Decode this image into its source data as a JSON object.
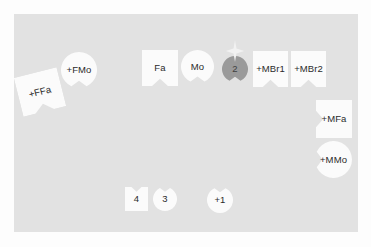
{
  "scene": {
    "title": "Graph node workspace",
    "background_color": "#fdfdfd",
    "panel_color": "#e2e2e2",
    "node_fill": "#fbfbfb",
    "node_fill_active": "#9a9a9a",
    "text_color": "#2a2a2a"
  },
  "nodes": [
    {
      "id": "ffa",
      "label": "+FFa",
      "shape": "square",
      "notch": "bottom",
      "fill": "#fbfbfb",
      "rotation": -14,
      "x": 18,
      "y": 72,
      "w": 44,
      "h": 40
    },
    {
      "id": "fmo",
      "label": "+FMo",
      "shape": "circle",
      "notch": "bottom",
      "fill": "#fbfbfb",
      "rotation": 0,
      "x": 61,
      "y": 52,
      "w": 36,
      "h": 36
    },
    {
      "id": "fa",
      "label": "Fa",
      "shape": "square",
      "notch": "bottom",
      "fill": "#fbfbfb",
      "rotation": 0,
      "x": 142,
      "y": 50,
      "w": 36,
      "h": 36
    },
    {
      "id": "mo",
      "label": "Mo",
      "shape": "circle",
      "notch": "bottom",
      "fill": "#fbfbfb",
      "rotation": 0,
      "x": 181,
      "y": 50,
      "w": 33,
      "h": 33
    },
    {
      "id": "n2",
      "label": "2",
      "shape": "circle",
      "notch": "bottom",
      "fill": "#9a9a9a",
      "rotation": 0,
      "x": 222,
      "y": 56,
      "w": 26,
      "h": 26
    },
    {
      "id": "mbr1",
      "label": "+MBr1",
      "shape": "square",
      "notch": "bottom",
      "fill": "#fbfbfb",
      "rotation": 0,
      "x": 253,
      "y": 51,
      "w": 35,
      "h": 36
    },
    {
      "id": "mbr2",
      "label": "+MBr2",
      "shape": "square",
      "notch": "bottom",
      "fill": "#fbfbfb",
      "rotation": 0,
      "x": 291,
      "y": 51,
      "w": 35,
      "h": 36
    },
    {
      "id": "mfa",
      "label": "+MFa",
      "shape": "square",
      "notch": "left",
      "fill": "#fbfbfb",
      "rotation": 0,
      "x": 316,
      "y": 100,
      "w": 36,
      "h": 38
    },
    {
      "id": "mmo",
      "label": "+MMo",
      "shape": "circle",
      "notch": "left",
      "fill": "#fbfbfb",
      "rotation": 0,
      "x": 315,
      "y": 141,
      "w": 37,
      "h": 37
    },
    {
      "id": "n4",
      "label": "4",
      "shape": "square",
      "notch": "top",
      "fill": "#fbfbfb",
      "rotation": 0,
      "x": 125,
      "y": 187,
      "w": 23,
      "h": 24
    },
    {
      "id": "n3",
      "label": "3",
      "shape": "circle",
      "notch": "top",
      "fill": "#fbfbfb",
      "rotation": 0,
      "x": 153,
      "y": 187,
      "w": 24,
      "h": 24
    },
    {
      "id": "np1",
      "label": "+1",
      "shape": "circle",
      "notch": "top",
      "fill": "#fbfbfb",
      "rotation": 0,
      "x": 207,
      "y": 187,
      "w": 26,
      "h": 26
    }
  ],
  "marker": {
    "name": "selection-sparkle",
    "color": "#f2f2f2",
    "x": 224,
    "y": 40,
    "w": 22,
    "h": 22
  }
}
